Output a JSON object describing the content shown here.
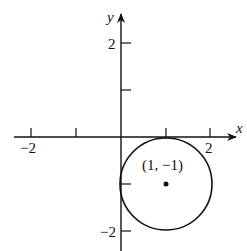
{
  "diagram": {
    "axes": {
      "x_label": "x",
      "y_label": "y",
      "x_ticks": [
        -2,
        -1,
        1,
        2
      ],
      "x_tick_labels": {
        "neg2": "−2",
        "pos2": "2"
      },
      "y_ticks": [
        -2,
        -1,
        1,
        2
      ],
      "y_tick_labels": {
        "pos2": "2",
        "neg2": "−2"
      }
    },
    "circle": {
      "center": [
        1,
        -1
      ],
      "radius": 1,
      "center_label": "(1, −1)"
    },
    "colors": {
      "stroke": "#111111",
      "background": "#ffffff"
    }
  }
}
